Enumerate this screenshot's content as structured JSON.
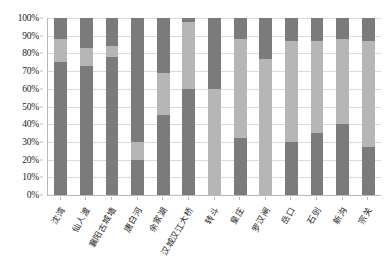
{
  "chart_data": {
    "type": "bar",
    "stacked": true,
    "stack_mode": "percent",
    "title": "",
    "subtitle": "",
    "xlabel": "",
    "ylabel": "",
    "ylim": [
      0,
      100
    ],
    "ytick_labels": [
      "0%",
      "10%",
      "20%",
      "30%",
      "40%",
      "50%",
      "60%",
      "70%",
      "80%",
      "90%",
      "100%"
    ],
    "ytick_values": [
      0,
      10,
      20,
      30,
      40,
      50,
      60,
      70,
      80,
      90,
      100
    ],
    "grid": true,
    "grid_axis": "y",
    "legend": false,
    "legend_position": "none",
    "categories": [
      "沈湾",
      "仙人渡",
      "襄阳古城墙",
      "唐白河",
      "余家湖",
      "汉城汉江大桥",
      "转斗",
      "皇庄",
      "罗汉闸",
      "岳口",
      "石剅",
      "新沟",
      "宗关"
    ],
    "series": [
      {
        "name": "series-1",
        "color": "#7b7b7b",
        "values": [
          75,
          73,
          78,
          20,
          45,
          60,
          0,
          32,
          0,
          30,
          35,
          40,
          27
        ]
      },
      {
        "name": "series-2",
        "color": "#b6b6b6",
        "values": [
          13,
          10,
          6,
          10,
          24,
          38,
          60,
          56,
          77,
          57,
          52,
          48,
          60
        ]
      },
      {
        "name": "series-3",
        "color": "#7b7b7b",
        "values": [
          12,
          17,
          16,
          70,
          31,
          2,
          40,
          12,
          23,
          13,
          13,
          12,
          13
        ]
      }
    ],
    "colors": {
      "dark_gray": "#7b7b7b",
      "light_gray": "#b6b6b6",
      "axis": "#b9b9b9",
      "grid": "#dcdcdc",
      "text": "#1d1d1d",
      "background": "#ffffff"
    }
  }
}
